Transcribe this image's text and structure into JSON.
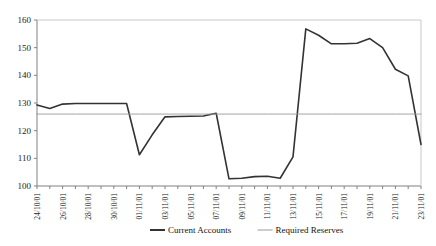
{
  "chart_data": {
    "type": "line",
    "title": "",
    "xlabel": "",
    "ylabel": "",
    "ylim": [
      100,
      160
    ],
    "ytick_values": [
      100,
      110,
      120,
      130,
      140,
      150,
      160
    ],
    "ytick_labels": [
      "100",
      "110",
      "120",
      "130",
      "140",
      "150",
      "160"
    ],
    "grid": false,
    "legend_position": "bottom",
    "x": [
      "24/10/01",
      "25/10/01",
      "26/10/01",
      "27/10/01",
      "28/10/01",
      "29/10/01",
      "30/10/01",
      "31/10/01",
      "01/11/01",
      "02/11/01",
      "03/11/01",
      "04/11/01",
      "05/11/01",
      "06/11/01",
      "07/11/01",
      "08/11/01",
      "09/11/01",
      "10/11/01",
      "11/11/01",
      "12/11/01",
      "13/11/01",
      "14/11/01",
      "15/11/01",
      "16/11/01",
      "17/11/01",
      "18/11/01",
      "19/11/01",
      "20/11/01",
      "21/11/01",
      "22/11/01",
      "23/11/01"
    ],
    "xtick_labels": [
      "24/10/01",
      "26/10/01",
      "28/10/01",
      "30/10/01",
      "01/11/01",
      "03/11/01",
      "05/11/01",
      "07/11/01",
      "09/11/01",
      "11/11/01",
      "13/11/01",
      "15/11/01",
      "17/11/01",
      "19/11/01",
      "21/11/01",
      "23/11/01"
    ],
    "series": [
      {
        "name": "Current Accounts",
        "color": "#333333",
        "values": [
          129.3,
          128.0,
          129.6,
          129.8,
          129.8,
          129.8,
          129.8,
          129.8,
          111.3,
          118.5,
          125.0,
          125.1,
          125.2,
          125.3,
          126.3,
          102.6,
          102.8,
          103.4,
          103.5,
          102.8,
          110.5,
          156.8,
          154.5,
          151.4,
          151.4,
          151.6,
          153.3,
          150.0,
          142.2,
          139.8,
          115.0
        ]
      },
      {
        "name": "Required Reserves",
        "color": "#9a9a9a",
        "values": [
          126.0,
          126.0,
          126.0,
          126.0,
          126.0,
          126.0,
          126.0,
          126.0,
          126.0,
          126.0,
          126.0,
          126.0,
          126.0,
          126.0,
          126.0,
          126.0,
          126.0,
          126.0,
          126.0,
          126.0,
          126.0,
          126.0,
          126.0,
          126.0,
          126.0,
          126.0,
          126.0,
          126.0,
          126.0,
          126.0,
          126.0
        ]
      }
    ]
  },
  "legend": {
    "items": [
      {
        "label": "Current Accounts",
        "color": "#333333"
      },
      {
        "label": "Required Reserves",
        "color": "#9a9a9a"
      }
    ]
  }
}
